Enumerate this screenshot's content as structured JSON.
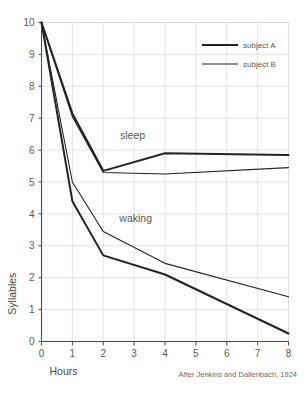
{
  "chart_data": {
    "type": "line",
    "title": "",
    "xlabel": "Hours",
    "ylabel": "Syllables",
    "xlim": [
      0,
      8
    ],
    "ylim": [
      0,
      10
    ],
    "x_ticks": [
      "0",
      "1",
      "2",
      "3",
      "4",
      "5",
      "6",
      "7",
      "8"
    ],
    "y_ticks": [
      "0",
      "1",
      "2",
      "3",
      "4",
      "5",
      "6",
      "7",
      "8",
      "9",
      "10"
    ],
    "grid": true,
    "legend_position": "top-right",
    "legend": [
      {
        "name": "subject A",
        "style": "thick"
      },
      {
        "name": "subject B",
        "style": "thin"
      }
    ],
    "annotations": [
      {
        "text": "sleep",
        "x": 2.95,
        "y": 6.35
      },
      {
        "text": "waking",
        "x": 3.05,
        "y": 3.75
      }
    ],
    "caption": "After Jenkins and Dallenbach, 1924",
    "x": [
      0,
      1,
      2,
      4,
      8
    ],
    "series": [
      {
        "name": "sleep - subject A",
        "group": "sleep",
        "subject": "subject A",
        "style": "thick",
        "values": [
          10.0,
          7.15,
          5.35,
          5.9,
          5.85
        ]
      },
      {
        "name": "sleep - subject B",
        "group": "sleep",
        "subject": "subject B",
        "style": "thin",
        "values": [
          10.0,
          7.05,
          5.3,
          5.25,
          5.45
        ]
      },
      {
        "name": "waking - subject A",
        "group": "waking",
        "subject": "subject A",
        "style": "thick",
        "values": [
          10.0,
          4.4,
          2.7,
          2.1,
          0.25
        ]
      },
      {
        "name": "waking - subject B",
        "group": "waking",
        "subject": "subject B",
        "style": "thin",
        "values": [
          10.0,
          5.0,
          3.45,
          2.45,
          1.4
        ]
      }
    ]
  }
}
